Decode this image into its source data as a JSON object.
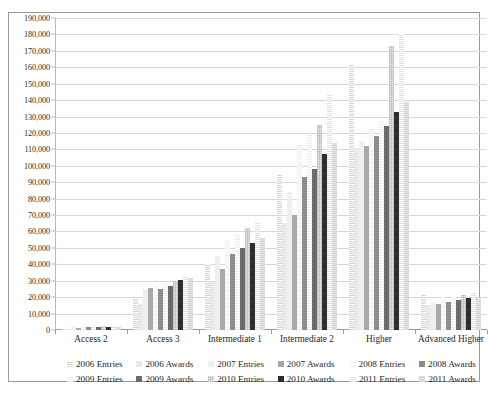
{
  "chart_data": {
    "type": "bar",
    "title": "",
    "xlabel": "",
    "ylabel": "",
    "ylim": [
      0,
      190000
    ],
    "ytick_step": 10000,
    "grid": true,
    "legend_position": "bottom",
    "categories": [
      "Access 2",
      "Access 3",
      "Intermediate 1",
      "Intermediate 2",
      "Higher",
      "Advanced Higher"
    ],
    "ytick_labels": [
      "190,000",
      "180,000",
      "170,000",
      "160,000",
      "150,000",
      "140,000",
      "130,000",
      "120,000",
      "110,000",
      "100,000",
      "90,000",
      "80,000",
      "70,000",
      "60,000",
      "50,000",
      "40,000",
      "30,000",
      "20,000",
      "10,000",
      "0"
    ],
    "series": [
      {
        "name": "2006 Entries",
        "color": "#d5d5d5",
        "pattern": "dotted",
        "values": [
          1200,
          21000,
          40000,
          95000,
          162000,
          21500
        ]
      },
      {
        "name": "2006 Awards",
        "color": "#eaeaea",
        "pattern": "solid",
        "values": [
          900,
          16000,
          29000,
          65000,
          111000,
          15500
        ]
      },
      {
        "name": "2007 Entries",
        "color": "#efefef",
        "pattern": "solid",
        "values": [
          1800,
          25000,
          45000,
          84000,
          115000,
          16500
        ]
      },
      {
        "name": "2007 Awards",
        "color": "#a8a8a8",
        "pattern": "solid",
        "values": [
          1300,
          25500,
          37000,
          70000,
          112000,
          16000
        ]
      },
      {
        "name": "2008 Entries",
        "color": "#f0f0f0",
        "pattern": "dotted",
        "values": [
          2100,
          26500,
          55000,
          113000,
          123000,
          20000
        ]
      },
      {
        "name": "2008 Awards",
        "color": "#8d8d8d",
        "pattern": "solid",
        "values": [
          1600,
          25000,
          46000,
          93000,
          118000,
          17000
        ]
      },
      {
        "name": "2009 Entries",
        "color": "#ededed",
        "pattern": "dotted",
        "values": [
          2400,
          27500,
          58000,
          119000,
          128000,
          21000
        ]
      },
      {
        "name": "2009 Awards",
        "color": "#6b6b6b",
        "pattern": "solid",
        "values": [
          1900,
          27000,
          50000,
          98000,
          124000,
          18500
        ]
      },
      {
        "name": "2010 Entries",
        "color": "#e6e6e6",
        "pattern": "crosshatch",
        "values": [
          2600,
          30000,
          62000,
          125000,
          173000,
          21500
        ]
      },
      {
        "name": "2010 Awards",
        "color": "#2e2e2e",
        "pattern": "solid",
        "values": [
          2000,
          30500,
          53000,
          107000,
          133000,
          19500
        ]
      },
      {
        "name": "2011 Entries",
        "color": "#e0e0e0",
        "pattern": "dotted",
        "values": [
          2300,
          32500,
          66000,
          143000,
          180000,
          22500
        ]
      },
      {
        "name": "2011 Awards",
        "color": "#dcdcdc",
        "pattern": "solid",
        "values": [
          1700,
          31500,
          56000,
          114000,
          139000,
          20000
        ]
      }
    ]
  }
}
